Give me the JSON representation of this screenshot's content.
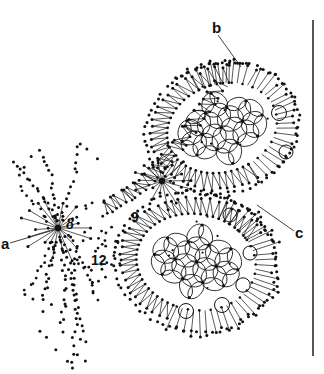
{
  "figure": {
    "title": "",
    "background_color": "#ffffff",
    "ink_color": "#111111",
    "width": 324,
    "height": 374,
    "labels": {
      "a": "a",
      "b": "b",
      "c": "c",
      "n8": "8",
      "n9": "9",
      "n12": "12"
    },
    "elements": {
      "right_rule": "vertical-rule",
      "node_left": "radiating-star-node-left",
      "node_center": "radiating-star-node-center",
      "lobe_upper": "upper-reticulate-lobe",
      "lobe_lower": "lower-reticulate-lobe",
      "leader_a": "leader-line-a",
      "leader_b": "leader-line-b",
      "leader_c": "leader-line-c"
    }
  }
}
